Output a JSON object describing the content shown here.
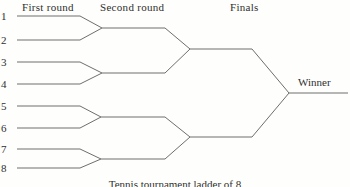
{
  "diagram": {
    "title_caption": "Tennis tournament ladder of 8",
    "headers": {
      "first_round": "First round",
      "second_round": "Second round",
      "finals": "Finals"
    },
    "players": [
      "1",
      "2",
      "3",
      "4",
      "5",
      "6",
      "7",
      "8"
    ],
    "winner_label": "Winner",
    "colors": {
      "line": "#6e6e6e",
      "text": "#2f2f2f",
      "background": "#fefefc"
    },
    "rounds_count": "3",
    "players_count": "8"
  }
}
